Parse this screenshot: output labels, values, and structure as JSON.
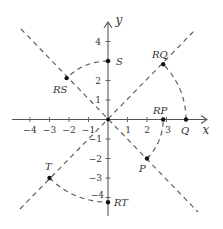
{
  "diagram": {
    "title": "",
    "axes": {
      "x_label": "x",
      "y_label": "y",
      "x_ticks": [
        "−4",
        "−3",
        "−2",
        "−1",
        "1",
        "2",
        "3"
      ],
      "y_ticks": [
        "4",
        "3",
        "2",
        "1",
        "−1",
        "−2",
        "−3",
        "−4"
      ]
    },
    "lines": [
      {
        "name": "line-y-equals-x",
        "equation": "y = x",
        "style": "dashed"
      },
      {
        "name": "line-y-equals-neg-x",
        "equation": "y = -x",
        "style": "dashed"
      }
    ],
    "points": [
      {
        "label": "S",
        "x": 0,
        "y": 3
      },
      {
        "label": "RS",
        "x": -2.12,
        "y": 2.12
      },
      {
        "label": "Q",
        "x": 4,
        "y": 0
      },
      {
        "label": "RQ",
        "x": 2.83,
        "y": 2.83
      },
      {
        "label": "P",
        "x": 2,
        "y": -2
      },
      {
        "label": "RP",
        "x": 2.83,
        "y": 0
      },
      {
        "label": "T",
        "x": -3,
        "y": -3
      },
      {
        "label": "RT",
        "x": 0,
        "y": -4.24
      }
    ],
    "arcs": [
      {
        "from": "S",
        "to": "RS",
        "style": "dashed"
      },
      {
        "from": "Q",
        "to": "RQ",
        "style": "dashed"
      },
      {
        "from": "P",
        "to": "RP",
        "style": "dashed"
      },
      {
        "from": "T",
        "to": "RT",
        "style": "dashed"
      }
    ],
    "labels": {
      "S": "S",
      "RS": "RS",
      "Q": "Q",
      "RQ": "RQ",
      "P": "P",
      "RP": "RP",
      "T": "T",
      "RT": "RT"
    }
  }
}
